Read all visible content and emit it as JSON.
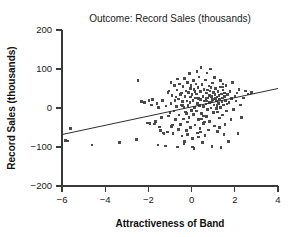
{
  "chart_data": {
    "type": "scatter",
    "title": "Outcome: Record Sales (thousands)",
    "xlabel": "Attractiveness of Band",
    "ylabel": "Record Sales (thousands)",
    "xlim": [
      -6,
      4
    ],
    "ylim": [
      -200,
      200
    ],
    "xticks": [
      -6,
      -4,
      -2,
      0,
      2,
      4
    ],
    "yticks": [
      -200,
      -100,
      0,
      100,
      200
    ],
    "xtick_labels": [
      "−6",
      "−4",
      "−2",
      "0",
      "2",
      "4"
    ],
    "ytick_labels": [
      "−200",
      "−100",
      "0",
      "100",
      "200"
    ],
    "grid": false,
    "legend": "none",
    "marker": "square",
    "marker_color": "#4a4a4a",
    "trendline": {
      "type": "linear-fit",
      "x": [
        -6,
        4
      ],
      "y": [
        -68,
        50
      ],
      "color": "#2e2e2e"
    },
    "points": [
      [
        -5.85,
        -83
      ],
      [
        -5.72,
        -85
      ],
      [
        -5.62,
        -52
      ],
      [
        -4.62,
        -95
      ],
      [
        -3.35,
        -88
      ],
      [
        -2.55,
        -81
      ],
      [
        -2.48,
        71
      ],
      [
        -2.32,
        16
      ],
      [
        -2.18,
        14
      ],
      [
        -2.05,
        -38
      ],
      [
        -1.98,
        19
      ],
      [
        -1.92,
        -40
      ],
      [
        -1.86,
        8
      ],
      [
        -1.8,
        22
      ],
      [
        -1.72,
        -41
      ],
      [
        -1.66,
        -34
      ],
      [
        -1.6,
        12
      ],
      [
        -1.55,
        -95
      ],
      [
        -1.5,
        -49
      ],
      [
        -1.45,
        -57
      ],
      [
        -1.4,
        -25
      ],
      [
        -1.36,
        18
      ],
      [
        -1.3,
        -64
      ],
      [
        -1.27,
        -66
      ],
      [
        -1.22,
        -97
      ],
      [
        -1.18,
        5
      ],
      [
        -1.12,
        -62
      ],
      [
        -1.08,
        -20
      ],
      [
        -1.04,
        44
      ],
      [
        -1.0,
        -12
      ],
      [
        -0.96,
        12
      ],
      [
        -0.93,
        -48
      ],
      [
        -0.9,
        32
      ],
      [
        -0.86,
        -66
      ],
      [
        -0.82,
        -8
      ],
      [
        -0.8,
        58
      ],
      [
        -0.77,
        20
      ],
      [
        -0.74,
        -30
      ],
      [
        -0.7,
        4
      ],
      [
        -0.68,
        46
      ],
      [
        -0.65,
        -100
      ],
      [
        -0.62,
        -55
      ],
      [
        -0.6,
        23
      ],
      [
        -0.58,
        -18
      ],
      [
        -0.55,
        62
      ],
      [
        -0.52,
        -42
      ],
      [
        -0.5,
        8
      ],
      [
        -0.48,
        38
      ],
      [
        -0.45,
        -72
      ],
      [
        -0.43,
        16
      ],
      [
        -0.4,
        55
      ],
      [
        -0.38,
        -28
      ],
      [
        -0.36,
        2
      ],
      [
        -0.34,
        75
      ],
      [
        -0.32,
        -86
      ],
      [
        -0.3,
        30
      ],
      [
        -0.28,
        -10
      ],
      [
        -0.26,
        44
      ],
      [
        -0.24,
        -58
      ],
      [
        -0.22,
        18
      ],
      [
        -0.2,
        66
      ],
      [
        -0.18,
        -36
      ],
      [
        -0.16,
        6
      ],
      [
        -0.14,
        40
      ],
      [
        -0.12,
        -24
      ],
      [
        -0.1,
        88
      ],
      [
        -0.08,
        14
      ],
      [
        -0.06,
        -50
      ],
      [
        -0.04,
        28
      ],
      [
        -0.02,
        58
      ],
      [
        0.0,
        -6
      ],
      [
        0.02,
        34
      ],
      [
        0.04,
        -78
      ],
      [
        0.06,
        20
      ],
      [
        0.08,
        70
      ],
      [
        0.1,
        -16
      ],
      [
        0.12,
        48
      ],
      [
        0.14,
        2
      ],
      [
        0.16,
        -44
      ],
      [
        0.18,
        26
      ],
      [
        0.2,
        62
      ],
      [
        0.22,
        -8
      ],
      [
        0.24,
        36
      ],
      [
        0.26,
        -64
      ],
      [
        0.28,
        12
      ],
      [
        0.3,
        52
      ],
      [
        0.32,
        -30
      ],
      [
        0.34,
        80
      ],
      [
        0.36,
        6
      ],
      [
        0.38,
        -52
      ],
      [
        0.4,
        42
      ],
      [
        0.42,
        22
      ],
      [
        0.44,
        104
      ],
      [
        0.46,
        -14
      ],
      [
        0.48,
        60
      ],
      [
        0.5,
        -88
      ],
      [
        0.52,
        30
      ],
      [
        0.54,
        4
      ],
      [
        0.56,
        -40
      ],
      [
        0.58,
        48
      ],
      [
        0.6,
        18
      ],
      [
        0.62,
        -70
      ],
      [
        0.64,
        72
      ],
      [
        0.66,
        10
      ],
      [
        0.68,
        -22
      ],
      [
        0.7,
        38
      ],
      [
        0.72,
        90
      ],
      [
        0.74,
        -4
      ],
      [
        0.76,
        26
      ],
      [
        0.78,
        -56
      ],
      [
        0.8,
        56
      ],
      [
        0.82,
        14
      ],
      [
        0.84,
        -34
      ],
      [
        0.86,
        44
      ],
      [
        0.88,
        100
      ],
      [
        0.9,
        0
      ],
      [
        0.92,
        30
      ],
      [
        0.94,
        -98
      ],
      [
        0.96,
        22
      ],
      [
        0.98,
        64
      ],
      [
        1.0,
        -12
      ],
      [
        1.02,
        40
      ],
      [
        1.04,
        8
      ],
      [
        1.06,
        -46
      ],
      [
        1.08,
        34
      ],
      [
        1.1,
        24
      ],
      [
        1.12,
        50
      ],
      [
        1.14,
        -2
      ],
      [
        1.16,
        18
      ],
      [
        1.18,
        28
      ],
      [
        1.2,
        -60
      ],
      [
        1.22,
        42
      ],
      [
        1.24,
        12
      ],
      [
        1.26,
        32
      ],
      [
        1.28,
        -26
      ],
      [
        1.3,
        22
      ],
      [
        1.32,
        54
      ],
      [
        1.34,
        2
      ],
      [
        1.36,
        -102
      ],
      [
        1.38,
        36
      ],
      [
        1.4,
        16
      ],
      [
        1.42,
        26
      ],
      [
        1.44,
        -18
      ],
      [
        1.46,
        46
      ],
      [
        1.48,
        8
      ],
      [
        1.5,
        -68
      ],
      [
        1.52,
        30
      ],
      [
        1.54,
        -42
      ],
      [
        1.58,
        20
      ],
      [
        1.6,
        58
      ],
      [
        1.62,
        -8
      ],
      [
        1.66,
        34
      ],
      [
        1.7,
        -86
      ],
      [
        1.74,
        14
      ],
      [
        1.78,
        42
      ],
      [
        1.82,
        -30
      ],
      [
        1.86,
        24
      ],
      [
        1.9,
        66
      ],
      [
        1.95,
        -4
      ],
      [
        2.0,
        30
      ],
      [
        2.05,
        18
      ],
      [
        2.1,
        38
      ],
      [
        2.15,
        -66
      ],
      [
        2.2,
        48
      ],
      [
        2.25,
        8
      ],
      [
        2.3,
        -24
      ],
      [
        2.4,
        26
      ],
      [
        2.5,
        44
      ],
      [
        2.62,
        36
      ],
      [
        2.78,
        40
      ],
      [
        -1.35,
        20
      ],
      [
        -0.88,
        -44
      ],
      [
        -0.52,
        34
      ],
      [
        0.05,
        -100
      ],
      [
        0.33,
        24
      ],
      [
        0.61,
        -36
      ],
      [
        0.89,
        52
      ],
      [
        1.17,
        6
      ],
      [
        1.45,
        62
      ],
      [
        -0.64,
        74
      ],
      [
        -0.18,
        -68
      ],
      [
        0.25,
        94
      ],
      [
        0.47,
        -28
      ],
      [
        0.69,
        18
      ],
      [
        1.05,
        78
      ],
      [
        1.29,
        -50
      ],
      [
        -1.1,
        40
      ],
      [
        -0.36,
        -92
      ],
      [
        0.15,
        42
      ],
      [
        0.55,
        -20
      ],
      [
        0.95,
        16
      ],
      [
        1.35,
        70
      ],
      [
        -0.42,
        6
      ],
      [
        0.41,
        -62
      ],
      [
        0.83,
        32
      ],
      [
        1.21,
        -10
      ],
      [
        -0.72,
        28
      ],
      [
        -0.06,
        50
      ],
      [
        0.31,
        -74
      ],
      [
        1.52,
        38
      ],
      [
        -1.52,
        2
      ],
      [
        -0.25,
        -14
      ],
      [
        0.67,
        24
      ],
      [
        1.63,
        10
      ],
      [
        -0.95,
        66
      ],
      [
        0.12,
        -104
      ],
      [
        0.74,
        46
      ],
      [
        1.43,
        54
      ]
    ]
  }
}
